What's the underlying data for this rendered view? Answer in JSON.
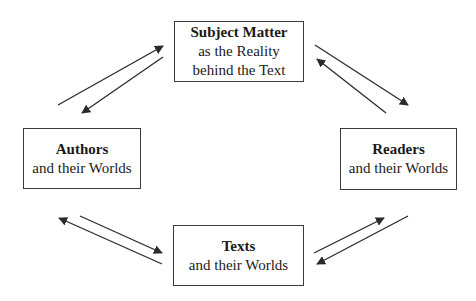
{
  "diagram": {
    "type": "cycle",
    "nodes": [
      {
        "id": "subject",
        "title": "Subject Matter",
        "lines": [
          "as the Reality",
          "behind the Text"
        ],
        "position": "top"
      },
      {
        "id": "authors",
        "title": "Authors",
        "lines": [
          "and their Worlds"
        ],
        "position": "left"
      },
      {
        "id": "readers",
        "title": "Readers",
        "lines": [
          "and their Worlds"
        ],
        "position": "right"
      },
      {
        "id": "texts",
        "title": "Texts",
        "lines": [
          "and their Worlds"
        ],
        "position": "bottom"
      }
    ],
    "edges": [
      {
        "from": "authors",
        "to": "subject",
        "direction": "bidirectional"
      },
      {
        "from": "subject",
        "to": "readers",
        "direction": "bidirectional"
      },
      {
        "from": "authors",
        "to": "texts",
        "direction": "bidirectional"
      },
      {
        "from": "texts",
        "to": "readers",
        "direction": "bidirectional"
      }
    ],
    "colors": {
      "line": "#2a2a2a",
      "border": "#3a3a3a",
      "background": "#ffffff"
    }
  },
  "nodes": {
    "subject": {
      "title": "Subject Matter",
      "line1": "as the Reality",
      "line2": "behind the Text"
    },
    "authors": {
      "title": "Authors",
      "line1": "and their Worlds"
    },
    "readers": {
      "title": "Readers",
      "line1": "and their Worlds"
    },
    "texts": {
      "title": "Texts",
      "line1": "and their Worlds"
    }
  }
}
